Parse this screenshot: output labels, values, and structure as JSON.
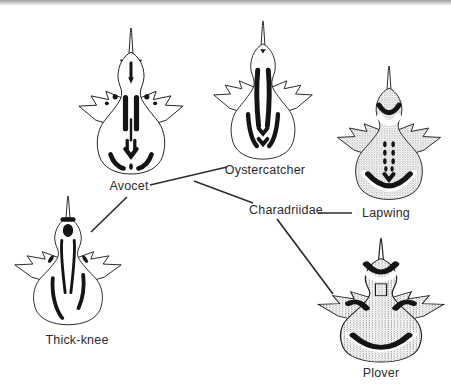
{
  "figure": {
    "family_label": "Charadriidae",
    "nodes": [
      {
        "id": "avocet",
        "label": "Avocet",
        "icon": "avocet-pterylosis-icon"
      },
      {
        "id": "oystercatcher",
        "label": "Oystercatcher",
        "icon": "oystercatcher-pterylosis-icon"
      },
      {
        "id": "lapwing",
        "label": "Lapwing",
        "icon": "lapwing-pterylosis-icon"
      },
      {
        "id": "thick-knee",
        "label": "Thick-knee",
        "icon": "thick-knee-pterylosis-icon"
      },
      {
        "id": "plover",
        "label": "Plover",
        "icon": "plover-pterylosis-icon"
      }
    ],
    "edges": [
      {
        "from": "Thick-knee",
        "to": "Avocet"
      },
      {
        "from": "Avocet",
        "to": "Oystercatcher"
      },
      {
        "from": "Oystercatcher",
        "to": "Charadriidae"
      },
      {
        "from": "Charadriidae",
        "to": "Lapwing"
      },
      {
        "from": "Charadriidae",
        "to": "Plover"
      }
    ],
    "colors": {
      "ink": "#1c1c1c",
      "stipple_gray": "#8a8a8a",
      "background": "#ffffff",
      "top_rule": "#a8a8a8"
    }
  }
}
